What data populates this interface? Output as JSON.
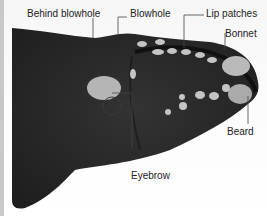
{
  "figure": {
    "colors": {
      "body": "#2b2b2b",
      "callosity": "#bdbdbd",
      "background": "#f7f7f7",
      "label_text": "#222222",
      "leader_line": "#444444"
    }
  },
  "labels": [
    {
      "id": "behind-blowhole",
      "text": "Behind blowhole"
    },
    {
      "id": "blowhole",
      "text": "Blowhole"
    },
    {
      "id": "lip-patches",
      "text": "Lip patches"
    },
    {
      "id": "bonnet",
      "text": "Bonnet"
    },
    {
      "id": "beard",
      "text": "Beard"
    },
    {
      "id": "eyebrow",
      "text": "Eyebrow"
    }
  ]
}
